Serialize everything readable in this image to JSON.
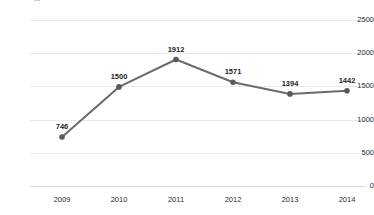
{
  "title": {
    "clipped_text": "...",
    "note": "title row cut off at top edge of screenshot"
  },
  "colors": {
    "line": "#6b6b6b",
    "marker": "#595959",
    "gridline": "#e9e9e9",
    "axis": "#d9d9d9",
    "text": "#2b2b2b",
    "background": "#ffffff"
  },
  "chart_data": {
    "type": "line",
    "title": "",
    "xlabel": "",
    "ylabel": "",
    "categories": [
      "2009",
      "2010",
      "2011",
      "2012",
      "2013",
      "2014"
    ],
    "values": [
      746,
      1500,
      1912,
      1571,
      1394,
      1442
    ],
    "data_labels": [
      "746",
      "1500",
      "1912",
      "1571",
      "1394",
      "1442"
    ],
    "ylim": [
      0,
      2500
    ],
    "ytick_labels": [
      "0",
      "500",
      "1000",
      "1500",
      "2000",
      "2500"
    ],
    "ytick_values": [
      0,
      500,
      1000,
      1500,
      2000,
      2500
    ],
    "grid": true,
    "grid_axis": "y",
    "legend": false,
    "legend_position": "none",
    "markers": true,
    "series": [
      {
        "name": "",
        "values": [
          746,
          1500,
          1912,
          1571,
          1394,
          1442
        ]
      }
    ]
  }
}
